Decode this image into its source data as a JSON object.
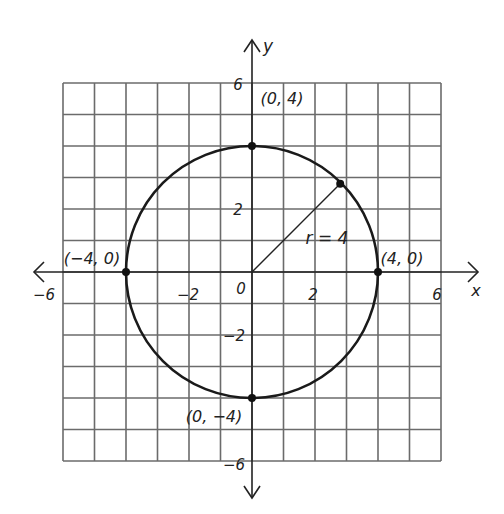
{
  "diagram": {
    "type": "coordinate-plane-circle",
    "grid": {
      "xmin": -6,
      "xmax": 6,
      "ymin": -6,
      "ymax": 6,
      "step": 1,
      "color": "#6b6b6b"
    },
    "axes": {
      "x_label": "x",
      "y_label": "y",
      "x_ticks": [
        {
          "value": -6,
          "label": "-6"
        },
        {
          "value": -2,
          "label": "-2"
        },
        {
          "value": 2,
          "label": "2"
        },
        {
          "value": 6,
          "label": "6"
        }
      ],
      "y_ticks": [
        {
          "value": 6,
          "label": "6"
        },
        {
          "value": 2,
          "label": "2"
        },
        {
          "value": -2,
          "label": "-2"
        },
        {
          "value": -6,
          "label": "-6"
        }
      ],
      "origin_label": "0",
      "color": "#222222"
    },
    "circle": {
      "center": [
        0,
        0
      ],
      "radius": 4,
      "color": "#1a1a1a"
    },
    "radius_label": "r = 4",
    "radius_endpoint": [
      2.8,
      2.8
    ],
    "points": [
      {
        "name": "top",
        "x": 0,
        "y": 4,
        "label": "(0, 4)"
      },
      {
        "name": "right",
        "x": 4,
        "y": 0,
        "label": "(4, 0)"
      },
      {
        "name": "bottom",
        "x": 0,
        "y": -4,
        "label": "(0, −4)"
      },
      {
        "name": "left",
        "x": -4,
        "y": 0,
        "label": "(−4, 0)"
      }
    ]
  }
}
